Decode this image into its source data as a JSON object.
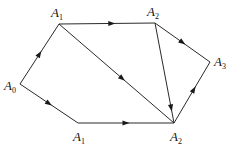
{
  "diagram": {
    "type": "directed-graph",
    "nodes": [
      {
        "id": "A0",
        "base": "A",
        "sub": "0",
        "x": 20,
        "y": 84,
        "lx": 4,
        "ly": 90
      },
      {
        "id": "A1_top",
        "base": "A",
        "sub": "1",
        "x": 59,
        "y": 24,
        "lx": 51,
        "ly": 17
      },
      {
        "id": "A2_top",
        "base": "A",
        "sub": "2",
        "x": 155,
        "y": 23,
        "lx": 147,
        "ly": 16
      },
      {
        "id": "A3",
        "base": "A",
        "sub": "3",
        "x": 210,
        "y": 62,
        "lx": 214,
        "ly": 66
      },
      {
        "id": "A1_bot",
        "base": "A",
        "sub": "1",
        "x": 78,
        "y": 123,
        "lx": 73,
        "ly": 141
      },
      {
        "id": "A2_bot",
        "base": "A",
        "sub": "2",
        "x": 174,
        "y": 123,
        "lx": 170,
        "ly": 141
      }
    ],
    "edges": [
      {
        "from": "A0",
        "to": "A1_top",
        "arrow_at": 0.5
      },
      {
        "from": "A0",
        "to": "A1_bot",
        "arrow_at": 0.5
      },
      {
        "from": "A1_top",
        "to": "A2_top",
        "arrow_at": 0.55
      },
      {
        "from": "A1_top",
        "to": "A2_bot",
        "arrow_at": 0.55
      },
      {
        "from": "A2_top",
        "to": "A3",
        "arrow_at": 0.5
      },
      {
        "from": "A2_top",
        "to": "A2_bot",
        "arrow_at": 0.85
      },
      {
        "from": "A1_bot",
        "to": "A2_bot",
        "arrow_at": 0.5
      },
      {
        "from": "A2_bot",
        "to": "A3",
        "arrow_at": 0.55
      }
    ],
    "colors": {
      "line": "#2a2a2a",
      "text": "#111111",
      "background": "#ffffff"
    }
  }
}
